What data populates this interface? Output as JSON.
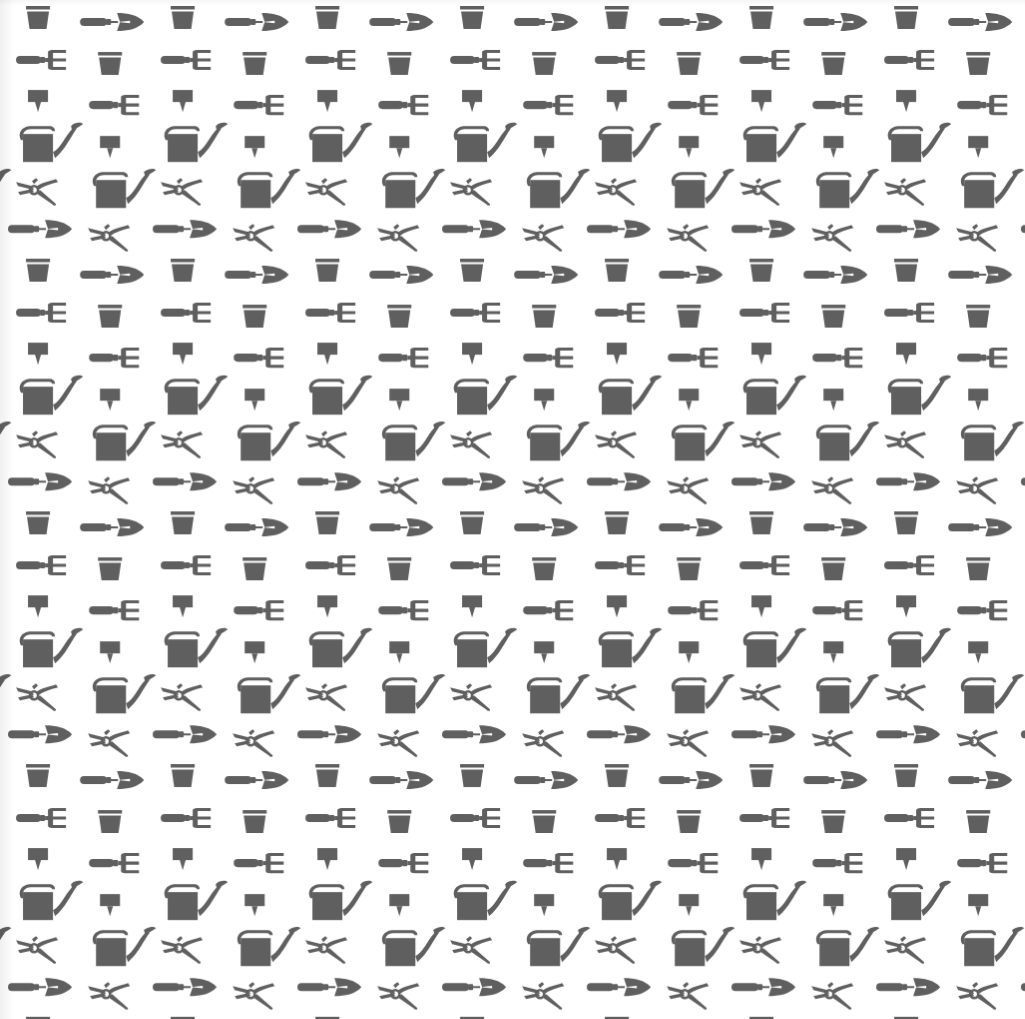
{
  "title": "Gardening tools seamless pattern",
  "pattern": {
    "background_color": "#ffffff",
    "icon_color": "#5f5f5f",
    "tile_width": 144.7,
    "tile_height": 252.7,
    "columns_visible": 7,
    "rows_visible": 4,
    "icons": [
      {
        "name": "flower-pot-icon"
      },
      {
        "name": "hand-trowel-icon"
      },
      {
        "name": "hand-fork-icon"
      },
      {
        "name": "plant-label-stake-icon"
      },
      {
        "name": "watering-can-icon"
      },
      {
        "name": "pruning-shears-icon"
      }
    ]
  }
}
